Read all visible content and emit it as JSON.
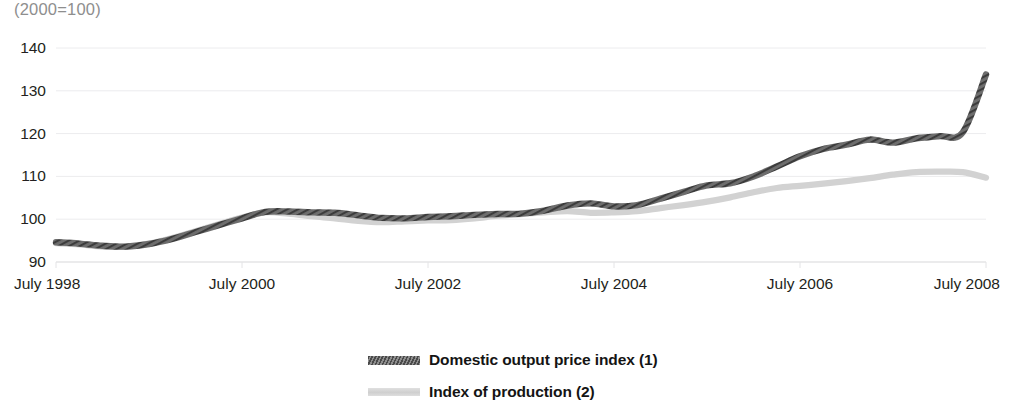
{
  "unit_note": "(2000=100)",
  "legend": {
    "items": [
      {
        "label": "Domestic output price index (1)",
        "swatch": "dark-hatched-line-swatch",
        "color": "#5a5a5a"
      },
      {
        "label": "Index of production (2)",
        "swatch": "light-gray-line-swatch",
        "color": "#d2d2d2"
      }
    ]
  },
  "chart_data": {
    "type": "line",
    "title": "",
    "subtitle": "",
    "xlabel": "",
    "ylabel": "",
    "unit_note": "(2000=100)",
    "grid": true,
    "grid_axis": "y",
    "legend_position": "bottom-center",
    "ylim": [
      90,
      140
    ],
    "yticks": [
      90,
      100,
      110,
      120,
      130,
      140
    ],
    "ytick_labels": [
      "90",
      "100",
      "110",
      "120",
      "130",
      "140"
    ],
    "xlim": [
      "July 1998",
      "July 2008"
    ],
    "xticks": [
      "July 1998",
      "July 2000",
      "July 2002",
      "July 2004",
      "July 2006",
      "July 2008"
    ],
    "x_interval": "quarterly",
    "x_values": [
      "Jul 1998",
      "Oct 1998",
      "Jan 1999",
      "Apr 1999",
      "Jul 1999",
      "Oct 1999",
      "Jan 2000",
      "Apr 2000",
      "Jul 2000",
      "Oct 2000",
      "Jan 2001",
      "Apr 2001",
      "Jul 2001",
      "Oct 2001",
      "Jan 2002",
      "Apr 2002",
      "Jul 2002",
      "Oct 2002",
      "Jan 2003",
      "Apr 2003",
      "Jul 2003",
      "Oct 2003",
      "Jan 2004",
      "Apr 2004",
      "Jul 2004",
      "Oct 2004",
      "Jan 2005",
      "Apr 2005",
      "Jul 2005",
      "Oct 2005",
      "Jan 2006",
      "Apr 2006",
      "Jul 2006",
      "Oct 2006",
      "Jan 2007",
      "Apr 2007",
      "Jul 2007",
      "Oct 2007",
      "Jan 2008",
      "Apr 2008",
      "Jul 2008"
    ],
    "series": [
      {
        "name": "Domestic output price index (1)",
        "color": "#5a5a5a",
        "style": "hatched-thick",
        "values": [
          94.6,
          94.3,
          93.8,
          93.6,
          94.2,
          95.4,
          97.0,
          98.6,
          100.2,
          101.7,
          101.8,
          101.6,
          101.5,
          100.9,
          100.3,
          100.2,
          100.5,
          100.7,
          101.0,
          101.2,
          101.3,
          102.0,
          103.2,
          103.7,
          103.0,
          103.3,
          104.8,
          106.4,
          107.9,
          108.4,
          110.0,
          112.3,
          114.7,
          116.4,
          117.4,
          118.6,
          117.9,
          118.9,
          119.4,
          120.3,
          125.6
        ],
        "end_value": 133.8,
        "notes": "Rises steeply from 2004; final point ~134"
      },
      {
        "name": "Index of production (2)",
        "color": "#d2d2d2",
        "style": "solid-thick",
        "values": [
          94.4,
          94.1,
          93.6,
          93.6,
          94.3,
          95.6,
          97.2,
          98.8,
          100.4,
          101.6,
          101.3,
          100.7,
          100.2,
          99.6,
          99.3,
          99.5,
          99.7,
          99.8,
          100.2,
          100.8,
          101.2,
          101.6,
          101.9,
          101.5,
          101.6,
          101.9,
          102.6,
          103.3,
          104.1,
          105.1,
          106.3,
          107.3,
          107.8,
          108.3,
          108.9,
          109.6,
          110.4,
          111.0,
          111.1,
          111.0,
          110.7
        ],
        "end_value": 109.7,
        "notes": "Flattens near 111 in 2007 then eases to ~110"
      }
    ]
  }
}
